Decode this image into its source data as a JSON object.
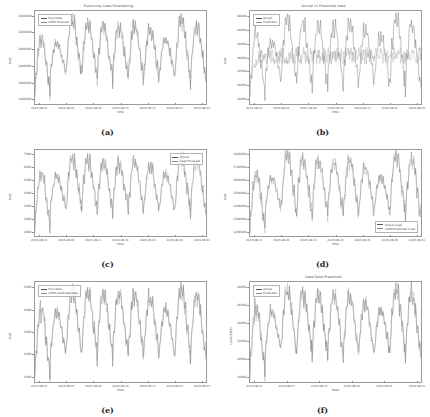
{
  "figure": {
    "background": "#ffffff",
    "trace_color": "#555555",
    "trace_color_secondary": "#8e8e8e",
    "layout": "2 columns x 3 rows of time-series subplots"
  },
  "panels": [
    {
      "caption": "(a)",
      "title": "Electricity Load Forecasting",
      "xlabel": "time",
      "ylabel": "load",
      "legend_position": "top-left",
      "legend": [
        "True Data",
        "LSTM Forecast"
      ],
      "yticks": [
        "2400000",
        "2200000",
        "2000000",
        "1800000",
        "1600000",
        "1400000"
      ],
      "xticks": [
        "2023-08-01",
        "2023-08-05",
        "2023-08-09",
        "2023-08-13",
        "2023-08-17",
        "2023-08-21",
        "2023-08-25"
      ],
      "chart_data": {
        "type": "line",
        "title": "Electricity Load Forecasting",
        "xlabel": "time",
        "ylabel": "load",
        "grid": false,
        "legend": [
          "True Data",
          "LSTM Forecast"
        ],
        "ylim": [
          1400000,
          2500000
        ],
        "x": [
          "2023-08-01",
          "2023-08-05",
          "2023-08-09",
          "2023-08-13",
          "2023-08-17",
          "2023-08-21",
          "2023-08-25"
        ],
        "series": [
          {
            "name": "True Data",
            "peaks": [
              2180000,
              2120000,
              2390000,
              2340000,
              2330000,
              2310000,
              2330000,
              2280000,
              2170000,
              2400000,
              2330000
            ],
            "troughs": [
              1500000,
              1760000,
              1750000,
              1720000,
              1700000,
              1700000,
              1690000,
              1700000,
              1730000,
              1710000,
              1660000
            ]
          },
          {
            "name": "LSTM Forecast",
            "peaks": [
              2150000,
              2100000,
              2370000,
              2320000,
              2310000,
              2290000,
              2310000,
              2260000,
              2150000,
              2380000,
              2310000
            ],
            "troughs": [
              1520000,
              1780000,
              1770000,
              1740000,
              1720000,
              1720000,
              1710000,
              1720000,
              1750000,
              1730000,
              1680000
            ]
          }
        ]
      }
    },
    {
      "caption": "(b)",
      "title": "Actual vs Predicted Load",
      "xlabel": "time",
      "ylabel": "load",
      "legend_position": "top-left",
      "legend": [
        "Actual",
        "Prediction"
      ],
      "yticks": [
        "48000",
        "44000",
        "40000",
        "36000",
        "32000",
        "28000",
        "24000"
      ],
      "xticks": [
        "2023-08-01",
        "2023-08-05",
        "2023-08-09",
        "2023-08-13",
        "2023-08-17",
        "2023-08-21",
        "2023-08-25"
      ],
      "chart_data": {
        "type": "line",
        "title": "Actual vs Predicted Load",
        "xlabel": "time",
        "ylabel": "load",
        "grid": false,
        "legend": [
          "Actual",
          "Prediction"
        ],
        "ylim": [
          23000,
          50000
        ],
        "x": [
          "2023-08-01",
          "2023-08-05",
          "2023-08-09",
          "2023-08-13",
          "2023-08-17",
          "2023-08-21",
          "2023-08-25"
        ],
        "series": [
          {
            "name": "Actual",
            "peaks": [
              43500,
              41500,
              47500,
              46000,
              46200,
              45800,
              46500,
              44500,
              42500,
              47800,
              46000
            ],
            "troughs": [
              24000,
              30000,
              29000,
              28500,
              28000,
              28200,
              28000,
              28500,
              29000,
              28500,
              27500
            ]
          },
          {
            "name": "Prediction",
            "description": "near-flat dense band around 37000 with small oscillation",
            "band_center": 37000,
            "band_half_width": 2500
          }
        ]
      }
    },
    {
      "caption": "(c)",
      "title": "",
      "xlabel": "time",
      "ylabel": "load",
      "legend_position": "top-right",
      "legend": [
        "Actual",
        "Load Forecast"
      ],
      "yticks": [
        "7000",
        "6000",
        "5000",
        "4000",
        "3000",
        "2000",
        "1000"
      ],
      "xticks": [
        "2023-08-01",
        "2023-08-06",
        "2023-08-11",
        "2023-08-16",
        "2023-08-21",
        "2023-08-26",
        "2023-08-31"
      ],
      "chart_data": {
        "type": "line",
        "title": "",
        "xlabel": "time",
        "ylabel": "load",
        "grid": false,
        "legend": [
          "Actual",
          "Load Forecast"
        ],
        "ylim": [
          900,
          7400
        ],
        "x": [
          "2023-08-01",
          "2023-08-06",
          "2023-08-11",
          "2023-08-16",
          "2023-08-21",
          "2023-08-26",
          "2023-08-31"
        ],
        "series": [
          {
            "name": "Actual",
            "peaks": [
              5600,
              5400,
              6800,
              6700,
              6500,
              6400,
              6500,
              6200,
              5600,
              6900,
              6600
            ],
            "troughs": [
              1500,
              3000,
              2900,
              2800,
              2700,
              2750,
              2700,
              2800,
              2900,
              2800,
              2500
            ]
          },
          {
            "name": "Load Forecast",
            "peaks": [
              5500,
              5300,
              6700,
              6600,
              6400,
              6300,
              6400,
              6100,
              5500,
              6800,
              6500
            ],
            "troughs": [
              1600,
              3100,
              3000,
              2900,
              2800,
              2850,
              2800,
              2900,
              3000,
              2900,
              2600
            ]
          }
        ]
      }
    },
    {
      "caption": "(d)",
      "title": "",
      "xlabel": "time",
      "ylabel": "load",
      "legend_position": "bottom-right",
      "legend": [
        "Actual Load",
        "LSTM Predicted Load"
      ],
      "yticks": [
        "1800000",
        "1700000",
        "1600000",
        "1500000",
        "1400000",
        "1300000",
        "1200000"
      ],
      "xticks": [
        "2023-08-01",
        "2023-08-06",
        "2023-08-11",
        "2023-08-16",
        "2023-08-21",
        "2023-08-26",
        "2023-08-31"
      ],
      "chart_data": {
        "type": "line",
        "title": "",
        "xlabel": "time",
        "ylabel": "load",
        "grid": false,
        "legend": [
          "Actual Load",
          "LSTM Predicted Load"
        ],
        "ylim": [
          1180000,
          1830000
        ],
        "x": [
          "2023-08-01",
          "2023-08-06",
          "2023-08-11",
          "2023-08-16",
          "2023-08-21",
          "2023-08-26",
          "2023-08-31"
        ],
        "series": [
          {
            "name": "Actual Load",
            "peaks": [
              1640000,
              1620000,
              1790000,
              1760000,
              1750000,
              1740000,
              1750000,
              1700000,
              1630000,
              1800000,
              1760000
            ],
            "troughs": [
              1210000,
              1380000,
              1370000,
              1350000,
              1340000,
              1350000,
              1340000,
              1350000,
              1370000,
              1360000,
              1320000
            ]
          },
          {
            "name": "LSTM Predicted Load",
            "peaks": [
              1630000,
              1610000,
              1780000,
              1750000,
              1740000,
              1730000,
              1740000,
              1690000,
              1620000,
              1790000,
              1750000
            ],
            "troughs": [
              1220000,
              1390000,
              1380000,
              1360000,
              1350000,
              1360000,
              1350000,
              1360000,
              1380000,
              1370000,
              1330000
            ]
          }
        ]
      }
    },
    {
      "caption": "(e)",
      "title": "",
      "xlabel": "time",
      "ylabel": "load",
      "legend_position": "top-left",
      "legend": [
        "True data",
        "LSTM predicted data"
      ],
      "yticks": [
        "5000",
        "4000",
        "3000",
        "2000",
        "1000"
      ],
      "xticks": [
        "2023-08-01",
        "2023-08-05",
        "2023-08-09",
        "2023-08-13",
        "2023-08-17",
        "2023-08-21",
        "2023-08-25"
      ],
      "chart_data": {
        "type": "line",
        "title": "",
        "xlabel": "time",
        "ylabel": "load",
        "grid": false,
        "legend": [
          "True data",
          "LSTM predicted data"
        ],
        "ylim": [
          600,
          5400
        ],
        "x": [
          "2023-08-01",
          "2023-08-05",
          "2023-08-09",
          "2023-08-13",
          "2023-08-17",
          "2023-08-21",
          "2023-08-25"
        ],
        "series": [
          {
            "name": "True data",
            "peaks": [
              4100,
              3950,
              5000,
              4900,
              4850,
              4800,
              4850,
              4600,
              4100,
              5050,
              4800
            ],
            "troughs": [
              800,
              2000,
              1950,
              1900,
              1850,
              1900,
              1850,
              1900,
              1950,
              1900,
              1700
            ]
          },
          {
            "name": "LSTM predicted data",
            "peaks": [
              4050,
              3900,
              4950,
              4850,
              4800,
              4750,
              4800,
              4550,
              4050,
              5000,
              4750
            ],
            "troughs": [
              850,
              2050,
              2000,
              1950,
              1900,
              1950,
              1900,
              1950,
              2000,
              1950,
              1750
            ]
          }
        ]
      }
    },
    {
      "caption": "(f)",
      "title": "Load Data Prediction",
      "xlabel": "Date",
      "ylabel": "Load (kWh)",
      "legend_position": "top-left",
      "legend": [
        "Actual",
        "Predicted"
      ],
      "yticks": [
        "28000",
        "26000",
        "24000",
        "22000",
        "20000",
        "18000"
      ],
      "xticks": [
        "2023-08-01",
        "2023-08-07",
        "2023-08-13",
        "2023-08-19",
        "2023-08-25",
        "2023-08-31"
      ],
      "chart_data": {
        "type": "line",
        "title": "Load Data Prediction",
        "xlabel": "Date",
        "ylabel": "Load (kWh)",
        "grid": false,
        "legend": [
          "Actual",
          "Predicted"
        ],
        "ylim": [
          17000,
          29500
        ],
        "x": [
          "2023-08-01",
          "2023-08-07",
          "2023-08-13",
          "2023-08-19",
          "2023-08-25",
          "2023-08-31"
        ],
        "series": [
          {
            "name": "Actual",
            "peaks": [
              26200,
              25800,
              28600,
              28200,
              28000,
              27800,
              28000,
              27000,
              26000,
              28700,
              28100
            ],
            "troughs": [
              17800,
              21000,
              20800,
              20500,
              20300,
              20400,
              20300,
              20500,
              20800,
              20600,
              20000
            ]
          },
          {
            "name": "Predicted",
            "peaks": [
              26000,
              25600,
              28400,
              28000,
              27800,
              27600,
              27800,
              26800,
              25800,
              28500,
              27900
            ],
            "troughs": [
              17900,
              21100,
              20900,
              20600,
              20400,
              20500,
              20400,
              20600,
              20900,
              20700,
              20100
            ]
          }
        ]
      }
    }
  ]
}
